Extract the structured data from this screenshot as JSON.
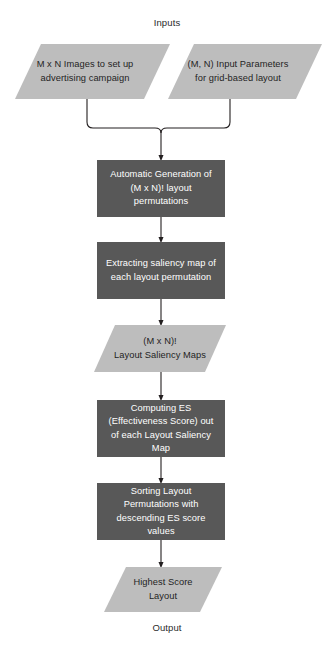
{
  "diagram": {
    "title_top": "Inputs",
    "title_bottom": "Output",
    "colors": {
      "parallelogram_fill": "#BDBDBD",
      "process_fill": "#585858",
      "process_text": "#FFFFFF",
      "parallelogram_text": "#1F1F1F",
      "connector": "#231F20",
      "background": "#FFFFFF"
    },
    "nodes": [
      {
        "id": "input-images",
        "shape": "parallelogram",
        "label": "M x N Images to set up\nadvertising campaign"
      },
      {
        "id": "input-parameters",
        "shape": "parallelogram",
        "label": "(M, N) Input Parameters\nfor grid-based layout"
      },
      {
        "id": "generate-permutations",
        "shape": "process",
        "label": "Automatic Generation of\n(M x N)! layout\npermutations"
      },
      {
        "id": "extract-saliency",
        "shape": "process",
        "label": "Extracting saliency map of\neach layout permutation"
      },
      {
        "id": "saliency-maps",
        "shape": "parallelogram",
        "label": "(M x N)!\nLayout Saliency Maps"
      },
      {
        "id": "compute-es",
        "shape": "process",
        "label": "Computing  ES\n(Effectiveness Score) out\nof each Layout Saliency\nMap"
      },
      {
        "id": "sort-layouts",
        "shape": "process",
        "label": "Sorting Layout\nPermutations with\ndescending ES score\nvalues"
      },
      {
        "id": "highest-score-layout",
        "shape": "parallelogram",
        "label": "Highest Score\nLayout"
      }
    ]
  }
}
